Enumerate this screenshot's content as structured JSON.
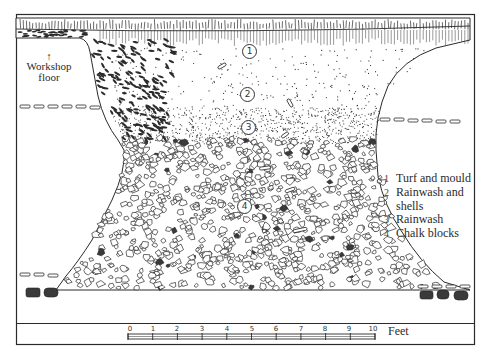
{
  "figure": {
    "type": "archaeological section drawing",
    "annotations": {
      "workshop_floor": {
        "line1": "Workshop",
        "line2": "floor",
        "arrow": "↑"
      }
    },
    "layer_markers": [
      {
        "id": "1",
        "x": 249,
        "y": 51
      },
      {
        "id": "2",
        "x": 247,
        "y": 94
      },
      {
        "id": "3",
        "x": 248,
        "y": 127
      },
      {
        "id": "4",
        "x": 244,
        "y": 206
      }
    ],
    "legend": {
      "items": [
        {
          "num": "1",
          "label": "Turf and mould"
        },
        {
          "num": "2",
          "label": "Rainwash and",
          "continuation": "shells"
        },
        {
          "num": "3",
          "label": "Rainwash"
        },
        {
          "num": "4",
          "label": "Chalk blocks"
        }
      ]
    },
    "scale_bar": {
      "ticks": [
        "0",
        "1",
        "2",
        "3",
        "4",
        "5",
        "6",
        "7",
        "8",
        "9",
        "10"
      ],
      "unit": "Feet"
    },
    "colors": {
      "ink": "#2a2a2a",
      "paper": "#ffffff",
      "flint": "#3a3a3a"
    }
  }
}
